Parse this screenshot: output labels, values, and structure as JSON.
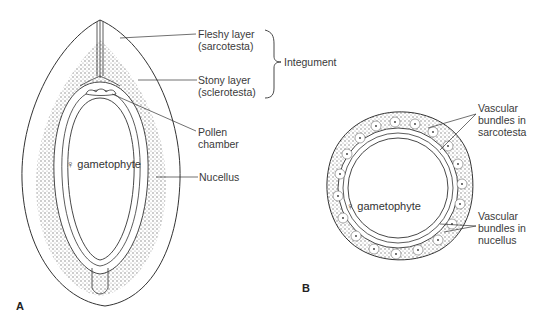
{
  "figure": {
    "panels": [
      {
        "id": "A",
        "label": "A",
        "view": "longitudinal section of ovule"
      },
      {
        "id": "B",
        "label": "B",
        "view": "transverse section of ovule"
      }
    ]
  },
  "panel_a": {
    "center_label": "♀ gametophyte",
    "callouts": [
      {
        "line1": "Fleshy layer",
        "line2": "(sarcotesta)"
      },
      {
        "line1": "Stony layer",
        "line2": "(sclerotesta)"
      },
      {
        "line1": "Pollen",
        "line2": "chamber"
      },
      {
        "line1": "Nucellus",
        "line2": ""
      }
    ],
    "bracket_label": "Integument"
  },
  "panel_b": {
    "center_label": "♀ gametophyte",
    "callouts": [
      {
        "line1": "Vascular",
        "line2": "bundles in",
        "line3": "sarcotesta"
      },
      {
        "line1": "Vascular",
        "line2": "bundles in",
        "line3": "nucellus"
      }
    ]
  },
  "colors": {
    "line": "#333333",
    "stipple": "#8a8a8a",
    "background": "#ffffff"
  }
}
